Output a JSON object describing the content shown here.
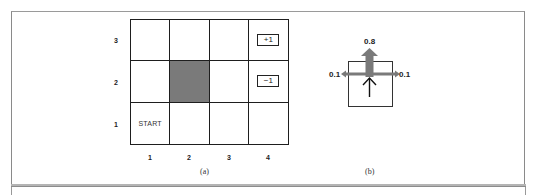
{
  "figure": {
    "panel_a": {
      "caption": "(a)",
      "y_labels": [
        "3",
        "2",
        "1"
      ],
      "x_labels": [
        "1",
        "2",
        "3",
        "4"
      ],
      "grid": {
        "columns": 4,
        "rows": 3,
        "wall_cell": {
          "col": 2,
          "row": 2
        },
        "start_cell": {
          "col": 1,
          "row": 1,
          "label": "START"
        },
        "terminal_cells": [
          {
            "col": 4,
            "row": 3,
            "label": "+1"
          },
          {
            "col": 4,
            "row": 2,
            "label": "−1"
          }
        ]
      }
    },
    "panel_b": {
      "caption": "(b)",
      "intended_direction": "up",
      "probabilities": {
        "forward": "0.8",
        "left": "0.1",
        "right": "0.1"
      },
      "colors": {
        "probability_arrow": "#7a7a7a",
        "intended_arrow": "#111111"
      }
    },
    "colors": {
      "wall": "#7a7a7a",
      "grid_line": "#1e1e1e",
      "frame": "#8a8a8a"
    }
  }
}
